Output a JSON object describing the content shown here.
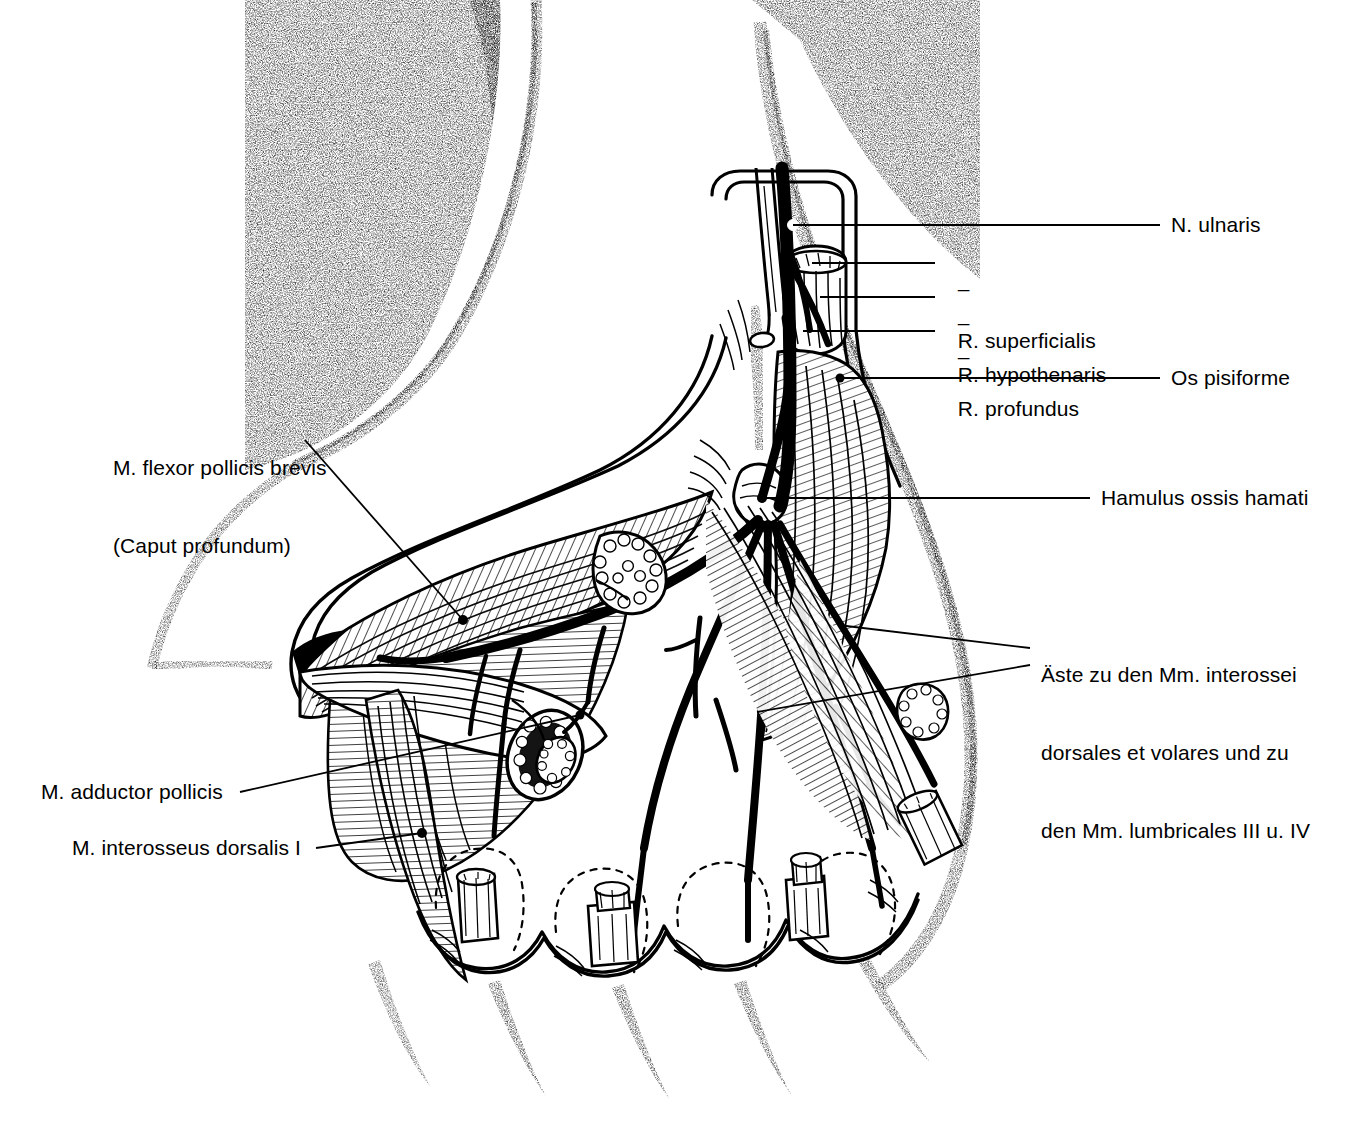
{
  "figure": {
    "language": "de",
    "style": "black-and-white pen-and-ink anatomical line drawing",
    "ink_color": "#000000",
    "background_color": "#ffffff"
  },
  "labels": {
    "n_ulnaris": "N. ulnaris",
    "r_superficialis": "R. superficialis",
    "r_hypothenaris": "R. hypothenaris",
    "r_profundus": "R. profundus",
    "os_pisiforme": "Os pisiforme",
    "hamulus_ossis_hamati": "Hamulus ossis hamati",
    "aeste_line1": "Äste zu den Mm. interossei",
    "aeste_line2": "dorsales et volares und zu",
    "aeste_line3": "den Mm. lumbricales III u. IV",
    "flexor_pollicis_line1": "M. flexor pollicis brevis",
    "flexor_pollicis_line2": "(Caput profundum)",
    "adductor_pollicis": "M. adductor pollicis",
    "interosseus_dorsalis": "M. interosseus dorsalis I"
  },
  "dash_prefix": "–",
  "leader_lines": [
    {
      "name": "n-ulnaris-leader",
      "from": [
        1160,
        225
      ],
      "to": [
        793,
        225
      ],
      "endpoint": "white-dot"
    },
    {
      "name": "r-superficialis-leader",
      "from": [
        935,
        263
      ],
      "to": [
        812,
        263
      ],
      "endpoint": "plain"
    },
    {
      "name": "r-hypothenaris-leader",
      "from": [
        935,
        297
      ],
      "to": [
        820,
        297
      ],
      "endpoint": "plain"
    },
    {
      "name": "r-profundus-leader",
      "from": [
        935,
        331
      ],
      "to": [
        803,
        331
      ],
      "endpoint": "plain"
    },
    {
      "name": "os-pisiforme-leader",
      "from": [
        1160,
        378
      ],
      "to": [
        840,
        378
      ],
      "endpoint": "black-dot"
    },
    {
      "name": "hamulus-leader",
      "from": [
        1090,
        498
      ],
      "to": [
        762,
        498
      ],
      "endpoint": "black-dot"
    },
    {
      "name": "aeste-leader-upper",
      "from": [
        1030,
        648
      ],
      "to": [
        838,
        625
      ],
      "endpoint": "plain"
    },
    {
      "name": "aeste-leader-lower",
      "from": [
        1030,
        665
      ],
      "to": [
        757,
        712
      ],
      "endpoint": "plain"
    },
    {
      "name": "flexor-pollicis-leader",
      "from": [
        305,
        440
      ],
      "to": [
        463,
        620
      ],
      "endpoint": "black-dot"
    },
    {
      "name": "adductor-leader",
      "from": [
        240,
        792
      ],
      "to": [
        580,
        715
      ],
      "endpoint": "black-dot"
    },
    {
      "name": "interosseus-leader",
      "from": [
        316,
        848
      ],
      "to": [
        422,
        833
      ],
      "endpoint": "black-dot"
    }
  ],
  "structures": [
    {
      "name": "forearm-soft-tissue",
      "render": "stipple"
    },
    {
      "name": "skin-incision-flap",
      "render": "double-outline"
    },
    {
      "name": "ulnar-nerve-trunk",
      "render": "solid-black"
    },
    {
      "name": "pisiform-bone-stump",
      "render": "cut-cylinder"
    },
    {
      "name": "hypothenar-muscle",
      "render": "hatched"
    },
    {
      "name": "thenar-muscle",
      "render": "hatched"
    },
    {
      "name": "adductor-pollicis-cut-end",
      "render": "cut-muscle"
    },
    {
      "name": "deep-palmar-arch",
      "render": "solid-black-vessel"
    },
    {
      "name": "nerve-branch-fan",
      "render": "solid-black-branches"
    },
    {
      "name": "flexor-tendon-stumps",
      "render": "cut-cylinder",
      "count": 4
    },
    {
      "name": "finger-web-skin",
      "render": "stipple"
    }
  ]
}
